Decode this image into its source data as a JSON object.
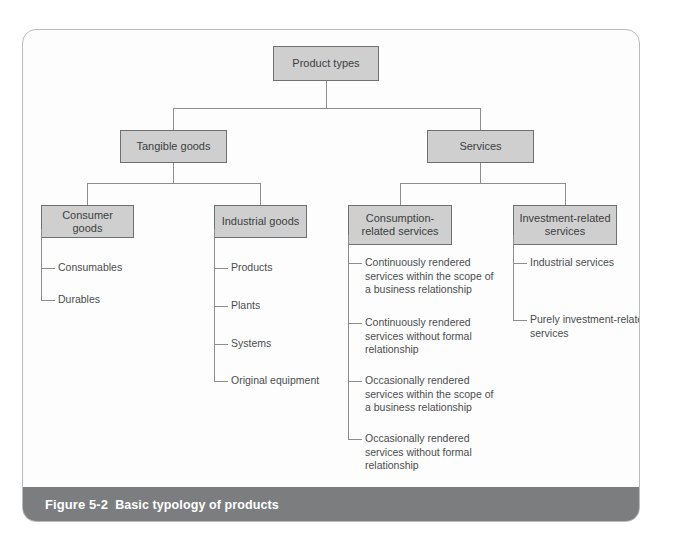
{
  "figure": {
    "number_label": "Figure 5-2",
    "title": "Basic typology of products"
  },
  "colors": {
    "node_fill": "#cfcfcf",
    "node_border": "#6e7173",
    "connector": "#8b8e90",
    "caption_bar": "#7b7d7f",
    "caption_text": "#ffffff",
    "card_border": "#b9bcbe",
    "page_background": "#ffffff"
  },
  "diagram": {
    "type": "tree",
    "root": {
      "label": "Product types"
    },
    "level2": [
      {
        "label": "Tangible goods"
      },
      {
        "label": "Services"
      }
    ],
    "level3": [
      {
        "label": "Consumer goods"
      },
      {
        "label": "Industrial goods"
      },
      {
        "label": "Consumption-related services"
      },
      {
        "label": "Investment-related services"
      }
    ],
    "leaves": {
      "consumer_goods": [
        "Consumables",
        "Durables"
      ],
      "industrial_goods": [
        "Products",
        "Plants",
        "Systems",
        "Original equipment"
      ],
      "consumption_related_services": [
        "Continuously rendered services within the scope of a business relationship",
        "Continuously rendered services without formal relationship",
        "Occasionally rendered services within the scope of a business relationship",
        "Occasionally rendered services without formal relationship"
      ],
      "investment_related_services": [
        "Industrial services",
        "Purely investment-related services"
      ]
    }
  }
}
